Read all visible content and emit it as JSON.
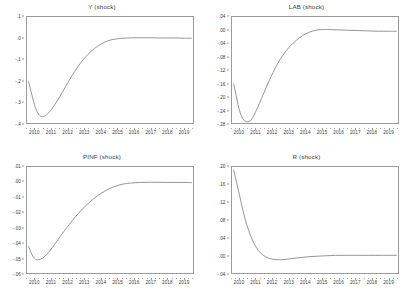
{
  "figure": {
    "background_color": "#ffffff",
    "line_color": "#7a7a7a",
    "axis_color": "#9a9a9a",
    "text_color": "#3a3a3a"
  },
  "chart_data": [
    {
      "type": "line",
      "title": "Y (shock)",
      "xlabel": "",
      "ylabel": "",
      "xlim": [
        2009.5,
        2019.6
      ],
      "ylim": [
        -0.4,
        0.1
      ],
      "grid": false,
      "legend": "none",
      "xticks": [
        "2010",
        "2011",
        "2012",
        "2013",
        "2014",
        "2015",
        "2016",
        "2017",
        "2018",
        "2019"
      ],
      "yticks": [
        ".1",
        ".0",
        "-.1",
        "-.2",
        "-.3",
        "-.4"
      ],
      "ytick_values": [
        0.1,
        0.0,
        -0.1,
        -0.2,
        -0.3,
        -0.4
      ],
      "series": [
        {
          "name": "Y (shock)",
          "x": [
            2009.6,
            2009.8,
            2010.0,
            2010.2,
            2010.4,
            2010.6,
            2010.9,
            2011.2,
            2011.6,
            2012.0,
            2012.4,
            2012.8,
            2013.2,
            2013.6,
            2014.0,
            2014.4,
            2014.8,
            2015.2,
            2015.6,
            2016.0,
            2016.5,
            2017.0,
            2017.5,
            2018.0,
            2018.5,
            2019.0,
            2019.5
          ],
          "y": [
            -0.205,
            -0.268,
            -0.325,
            -0.358,
            -0.37,
            -0.366,
            -0.345,
            -0.312,
            -0.262,
            -0.208,
            -0.157,
            -0.113,
            -0.077,
            -0.049,
            -0.028,
            -0.013,
            -0.005,
            -0.001,
            0.001,
            0.002,
            0.002,
            0.002,
            0.001,
            0.001,
            0.001,
            0.0,
            0.0
          ]
        }
      ]
    },
    {
      "type": "line",
      "title": "LAB (shock)",
      "xlabel": "",
      "ylabel": "",
      "xlim": [
        2009.5,
        2019.6
      ],
      "ylim": [
        -0.28,
        0.04
      ],
      "grid": false,
      "legend": "none",
      "xticks": [
        "2010",
        "2011",
        "2012",
        "2013",
        "2014",
        "2015",
        "2016",
        "2017",
        "2018",
        "2019"
      ],
      "yticks": [
        ".04",
        ".00",
        "-.04",
        "-.08",
        "-.12",
        "-.16",
        "-.20",
        "-.24",
        "-.28"
      ],
      "ytick_values": [
        0.04,
        0.0,
        -0.04,
        -0.08,
        -0.12,
        -0.16,
        -0.2,
        -0.24,
        -0.28
      ],
      "series": [
        {
          "name": "LAB (shock)",
          "x": [
            2009.6,
            2009.75,
            2009.9,
            2010.1,
            2010.3,
            2010.5,
            2010.7,
            2011.0,
            2011.4,
            2011.8,
            2012.2,
            2012.6,
            2013.0,
            2013.4,
            2013.8,
            2014.2,
            2014.6,
            2015.0,
            2015.4,
            2016.0,
            2016.6,
            2017.2,
            2017.8,
            2018.4,
            2019.0,
            2019.5
          ],
          "y": [
            -0.162,
            -0.196,
            -0.232,
            -0.262,
            -0.274,
            -0.276,
            -0.268,
            -0.24,
            -0.194,
            -0.148,
            -0.108,
            -0.075,
            -0.05,
            -0.031,
            -0.016,
            -0.006,
            0.0,
            0.002,
            0.002,
            0.001,
            0.0,
            -0.001,
            -0.002,
            -0.003,
            -0.003,
            -0.003
          ]
        }
      ]
    },
    {
      "type": "line",
      "title": "PINF (shock)",
      "xlabel": "",
      "ylabel": "",
      "xlim": [
        2009.5,
        2019.6
      ],
      "ylim": [
        -0.06,
        0.01
      ],
      "grid": false,
      "legend": "none",
      "xticks": [
        "2010",
        "2011",
        "2012",
        "2013",
        "2014",
        "2015",
        "2016",
        "2017",
        "2018",
        "2019"
      ],
      "yticks": [
        ".01",
        ".00",
        "-.01",
        "-.02",
        "-.03",
        "-.04",
        "-.05",
        "-.06"
      ],
      "ytick_values": [
        0.01,
        0.0,
        -0.01,
        -0.02,
        -0.03,
        -0.04,
        -0.05,
        -0.06
      ],
      "series": [
        {
          "name": "PINF (shock)",
          "x": [
            2009.6,
            2009.8,
            2010.0,
            2010.2,
            2010.5,
            2010.9,
            2011.3,
            2011.8,
            2012.3,
            2012.8,
            2013.3,
            2013.8,
            2014.3,
            2014.8,
            2015.3,
            2015.8,
            2016.4,
            2017.0,
            2017.6,
            2018.2,
            2018.8,
            2019.5
          ],
          "y": [
            -0.0425,
            -0.0478,
            -0.0508,
            -0.0512,
            -0.0498,
            -0.0452,
            -0.0392,
            -0.0318,
            -0.0248,
            -0.0186,
            -0.0133,
            -0.009,
            -0.0055,
            -0.003,
            -0.0014,
            -0.0006,
            -0.0002,
            -0.0001,
            -0.0001,
            -0.0002,
            -0.0002,
            -0.0003
          ]
        }
      ]
    },
    {
      "type": "line",
      "title": "R (shock)",
      "xlabel": "",
      "ylabel": "",
      "xlim": [
        2009.5,
        2019.6
      ],
      "ylim": [
        -0.04,
        0.2
      ],
      "grid": false,
      "legend": "none",
      "xticks": [
        "2010",
        "2011",
        "2012",
        "2013",
        "2014",
        "2015",
        "2016",
        "2017",
        "2018",
        "2019"
      ],
      "yticks": [
        ".20",
        ".16",
        ".12",
        ".08",
        ".04",
        ".00",
        "-.04"
      ],
      "ytick_values": [
        0.2,
        0.16,
        0.12,
        0.08,
        0.04,
        0.0,
        -0.04
      ],
      "series": [
        {
          "name": "R (shock)",
          "x": [
            2009.6,
            2009.75,
            2009.9,
            2010.1,
            2010.3,
            2010.5,
            2010.7,
            2010.9,
            2011.1,
            2011.4,
            2011.7,
            2012.0,
            2012.4,
            2012.8,
            2013.2,
            2013.7,
            2014.2,
            2014.7,
            2015.2,
            2015.8,
            2016.4,
            2017.0,
            2017.8,
            2018.6,
            2019.5
          ],
          "y": [
            0.193,
            0.17,
            0.146,
            0.112,
            0.082,
            0.058,
            0.038,
            0.023,
            0.011,
            0.0,
            -0.006,
            -0.009,
            -0.01,
            -0.009,
            -0.007,
            -0.005,
            -0.003,
            -0.002,
            -0.001,
            0.0,
            0.0,
            0.0,
            0.0,
            0.0,
            0.0
          ]
        }
      ]
    }
  ]
}
